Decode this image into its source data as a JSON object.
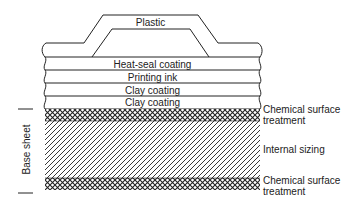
{
  "diagram": {
    "type": "cross-section",
    "layers_top": {
      "plastic": "Plastic",
      "heat_seal": "Heat-seal coating",
      "printing_ink": "Printing ink",
      "clay_coating_1": "Clay coating",
      "clay_coating_2": "Clay coating"
    },
    "side_labels": {
      "chem_top_line1": "Chemical surface",
      "chem_top_line2": "treatment",
      "internal_sizing": "Internal sizing",
      "chem_bottom_line1": "Chemical surface",
      "chem_bottom_line2": "treatment"
    },
    "bracket_label": "Base sheet",
    "colors": {
      "line": "#222222",
      "background": "#ffffff"
    }
  }
}
